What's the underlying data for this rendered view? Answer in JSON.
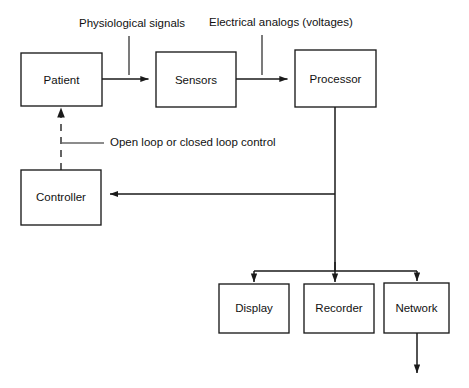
{
  "diagram": {
    "stroke_color": "#1a1a1a",
    "background_color": "#ffffff",
    "nodes": [
      {
        "id": "patient",
        "label": "Patient",
        "x": 21,
        "y": 53,
        "w": 81,
        "h": 53
      },
      {
        "id": "sensors",
        "label": "Sensors",
        "x": 156,
        "y": 52,
        "w": 80,
        "h": 55
      },
      {
        "id": "processor",
        "label": "Processor",
        "x": 295,
        "y": 50,
        "w": 81,
        "h": 57
      },
      {
        "id": "controller",
        "label": "Controller",
        "x": 21,
        "y": 170,
        "w": 80,
        "h": 55
      },
      {
        "id": "display",
        "label": "Display",
        "x": 219,
        "y": 284,
        "w": 70,
        "h": 49
      },
      {
        "id": "recorder",
        "label": "Recorder",
        "x": 304,
        "y": 284,
        "w": 70,
        "h": 49
      },
      {
        "id": "network",
        "label": "Network",
        "x": 384,
        "y": 283,
        "w": 65,
        "h": 50
      }
    ],
    "annotations": [
      {
        "id": "physiological-signals",
        "label": "Physiological signals",
        "x": 79,
        "y": 24
      },
      {
        "id": "electrical-analogs",
        "label": "Electrical analogs (voltages)",
        "x": 209,
        "y": 23
      },
      {
        "id": "control-mode",
        "label": "Open loop or closed loop control",
        "x": 110,
        "y": 143
      }
    ],
    "edges": [
      {
        "id": "patient-to-sensors",
        "from": "patient",
        "to": "sensors",
        "style": "solid",
        "arrow": true
      },
      {
        "id": "sensors-to-processor",
        "from": "sensors",
        "to": "processor",
        "style": "solid",
        "arrow": true
      },
      {
        "id": "processor-to-controller",
        "from": "processor",
        "to": "controller",
        "style": "solid",
        "arrow": true
      },
      {
        "id": "controller-to-patient",
        "from": "controller",
        "to": "patient",
        "style": "dashed",
        "arrow": true
      },
      {
        "id": "processor-to-display",
        "from": "processor",
        "to": "display",
        "style": "solid",
        "arrow": true
      },
      {
        "id": "processor-to-recorder",
        "from": "processor",
        "to": "recorder",
        "style": "solid",
        "arrow": true
      },
      {
        "id": "processor-to-network",
        "from": "processor",
        "to": "network",
        "style": "solid",
        "arrow": true
      },
      {
        "id": "network-output",
        "from": "network",
        "to": "",
        "style": "solid",
        "arrow": true
      }
    ]
  }
}
